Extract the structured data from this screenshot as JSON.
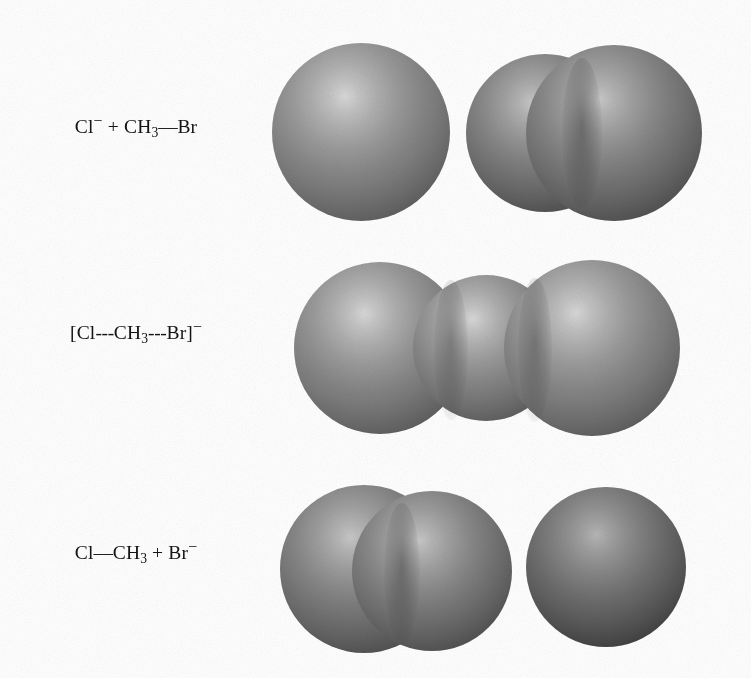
{
  "figure": {
    "title": "SN2 reaction of chloride ion with bromomethane",
    "background_color": "#ffffff",
    "width": 751,
    "height": 678
  },
  "rows": [
    {
      "id": "reactants",
      "stage": "reactants",
      "label": {
        "full_text": "Cl⁻ + CH₃—Br",
        "parts": {
          "chloride": "Cl",
          "chloride_charge": "−",
          "plus": "+",
          "methyl": "CH",
          "methyl_count": "3",
          "bond": "—",
          "bromine": "Br"
        }
      },
      "molecules": [
        {
          "name": "chloride-ion",
          "formula": "Cl⁻",
          "atoms": [
            {
              "element": "Cl",
              "shade": "shade-light",
              "diameter": 178
            }
          ]
        },
        {
          "name": "bromomethane",
          "formula": "CH3Br",
          "atoms": [
            {
              "element": "CH3",
              "shade": "shade-mid",
              "diameter": 158
            },
            {
              "element": "Br",
              "shade": "shade-mid",
              "diameter": 176
            }
          ]
        }
      ]
    },
    {
      "id": "transition",
      "stage": "transition-state",
      "label": {
        "full_text": "[Cl---CH₃---Br]⁻",
        "parts": {
          "bracket_open": "[",
          "chloride": "Cl",
          "dashes_left": "---",
          "methyl": "CH",
          "methyl_count": "3",
          "dashes_right": "---",
          "bromine": "Br",
          "bracket_close": "]",
          "charge": "−"
        }
      },
      "molecules": [
        {
          "name": "transition-state-complex",
          "formula": "[Cl---CH3---Br]⁻",
          "atoms": [
            {
              "element": "Cl",
              "shade": "shade-light",
              "diameter": 172
            },
            {
              "element": "CH3",
              "shade": "shade-light",
              "diameter": 146
            },
            {
              "element": "Br",
              "shade": "shade-light",
              "diameter": 176
            }
          ]
        }
      ]
    },
    {
      "id": "products",
      "stage": "products",
      "label": {
        "full_text": "Cl—CH₃ + Br⁻",
        "parts": {
          "chloride": "Cl",
          "bond": "—",
          "methyl": "CH",
          "methyl_count": "3",
          "plus": "+",
          "bromine": "Br",
          "bromide_charge": "−"
        }
      },
      "molecules": [
        {
          "name": "chloromethane",
          "formula": "CH3Cl",
          "atoms": [
            {
              "element": "Cl",
              "shade": "shade-mid",
              "diameter": 168
            },
            {
              "element": "CH3",
              "shade": "shade-mid",
              "diameter": 160
            }
          ]
        },
        {
          "name": "bromide-ion",
          "formula": "Br⁻",
          "atoms": [
            {
              "element": "Br",
              "shade": "shade-dark",
              "diameter": 160
            }
          ]
        }
      ]
    }
  ],
  "colors": {
    "background": "#ffffff",
    "text": "#141414",
    "sphere_highlight": "#d8d8d8",
    "sphere_midtone": "#8c8c8c",
    "sphere_shadow": "#2d2d2d"
  }
}
